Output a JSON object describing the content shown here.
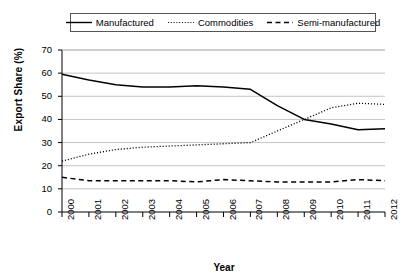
{
  "chart_data": {
    "type": "line",
    "title": "",
    "xlabel": "Year",
    "ylabel": "Export Share (%)",
    "x": [
      2000,
      2001,
      2002,
      2003,
      2004,
      2005,
      2006,
      2007,
      2008,
      2009,
      2010,
      2011,
      2012
    ],
    "categories": [
      "2000",
      "2001",
      "2002",
      "2003",
      "2004",
      "2005",
      "2006",
      "2007",
      "2008",
      "2009",
      "2010",
      "2011",
      "2012"
    ],
    "xlim": [
      2000,
      2012
    ],
    "ylim": [
      0,
      70
    ],
    "yticks": [
      0,
      10,
      20,
      30,
      40,
      50,
      60,
      70
    ],
    "ytick_labels": [
      "0",
      "10",
      "20",
      "30",
      "40",
      "50",
      "60",
      "70"
    ],
    "grid": true,
    "grid_axis": "y",
    "legend_position": "top-center",
    "series": [
      {
        "name": "Manufactured",
        "style": "solid",
        "color": "#000000",
        "values": [
          59.5,
          57.0,
          55.0,
          54.0,
          54.0,
          54.5,
          54.0,
          53.0,
          46.0,
          40.0,
          38.0,
          35.5,
          36.0
        ]
      },
      {
        "name": "Commodities",
        "style": "dotted",
        "color": "#000000",
        "values": [
          22.0,
          25.0,
          27.0,
          28.0,
          28.5,
          29.0,
          29.5,
          30.0,
          35.0,
          40.0,
          45.0,
          47.0,
          46.5
        ]
      },
      {
        "name": "Semi-manufactured",
        "style": "dashed",
        "color": "#000000",
        "values": [
          15.0,
          13.5,
          13.5,
          13.5,
          13.5,
          13.0,
          14.0,
          13.5,
          13.0,
          13.0,
          13.0,
          14.0,
          13.5
        ]
      }
    ]
  },
  "legend": {
    "items": [
      {
        "label": "Manufactured",
        "icon": "solid-line-icon"
      },
      {
        "label": "Commodities",
        "icon": "dotted-line-icon"
      },
      {
        "label": "Semi-manufactured",
        "icon": "dashed-line-icon"
      }
    ]
  },
  "colors": {
    "line": "#000000",
    "grid": "#b5b5b5",
    "axis": "#000000",
    "background": "#ffffff"
  }
}
